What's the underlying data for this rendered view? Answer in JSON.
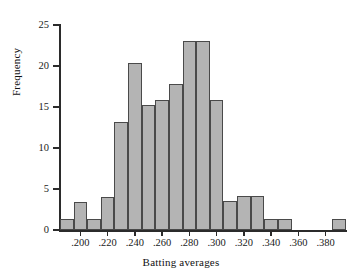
{
  "chart_data": {
    "type": "bar",
    "title": "",
    "xlabel": "Batting averages",
    "ylabel": "Frequency",
    "xlim": [
      0.185,
      0.395
    ],
    "ylim": [
      0,
      25
    ],
    "grid": false,
    "legend": null,
    "bin_width": 0.01,
    "xticks": [
      ".200",
      ".220",
      ".240",
      ".260",
      ".280",
      ".300",
      ".320",
      ".340",
      ".360",
      ".380"
    ],
    "xtick_values": [
      0.2,
      0.22,
      0.24,
      0.26,
      0.28,
      0.3,
      0.32,
      0.34,
      0.36,
      0.38
    ],
    "yticks": [
      "0",
      "5",
      "10",
      "15",
      "20",
      "25"
    ],
    "ytick_values": [
      0,
      5,
      10,
      15,
      20,
      25
    ],
    "bar_color": "#b4b4b4",
    "bar_edge_color": "#4a4a4a",
    "axis_color": "#2b2b2b",
    "bins": [
      {
        "x0": 0.185,
        "x1": 0.195,
        "value": 1.3
      },
      {
        "x0": 0.195,
        "x1": 0.205,
        "value": 3.4
      },
      {
        "x0": 0.205,
        "x1": 0.215,
        "value": 1.3
      },
      {
        "x0": 0.215,
        "x1": 0.225,
        "value": 4.0
      },
      {
        "x0": 0.225,
        "x1": 0.235,
        "value": 13.2
      },
      {
        "x0": 0.235,
        "x1": 0.245,
        "value": 20.4
      },
      {
        "x0": 0.245,
        "x1": 0.255,
        "value": 15.3
      },
      {
        "x0": 0.255,
        "x1": 0.265,
        "value": 15.8
      },
      {
        "x0": 0.265,
        "x1": 0.275,
        "value": 17.8
      },
      {
        "x0": 0.275,
        "x1": 0.285,
        "value": 23.0
      },
      {
        "x0": 0.285,
        "x1": 0.295,
        "value": 23.0
      },
      {
        "x0": 0.295,
        "x1": 0.305,
        "value": 15.8
      },
      {
        "x0": 0.305,
        "x1": 0.315,
        "value": 3.5
      },
      {
        "x0": 0.315,
        "x1": 0.325,
        "value": 4.2
      },
      {
        "x0": 0.325,
        "x1": 0.335,
        "value": 4.2
      },
      {
        "x0": 0.335,
        "x1": 0.345,
        "value": 1.3
      },
      {
        "x0": 0.345,
        "x1": 0.355,
        "value": 1.3
      },
      {
        "x0": 0.355,
        "x1": 0.365,
        "value": 0
      },
      {
        "x0": 0.365,
        "x1": 0.375,
        "value": 0
      },
      {
        "x0": 0.375,
        "x1": 0.385,
        "value": 0
      },
      {
        "x0": 0.385,
        "x1": 0.395,
        "value": 1.3
      }
    ],
    "categories": [
      ".185-.195",
      ".195-.205",
      ".205-.215",
      ".215-.225",
      ".225-.235",
      ".235-.245",
      ".245-.255",
      ".255-.265",
      ".265-.275",
      ".275-.285",
      ".285-.295",
      ".295-.305",
      ".305-.315",
      ".315-.325",
      ".325-.335",
      ".335-.345",
      ".345-.355",
      ".355-.365",
      ".365-.375",
      ".375-.385",
      ".385-.395"
    ],
    "values": [
      1.3,
      3.4,
      1.3,
      4.0,
      13.2,
      20.4,
      15.3,
      15.8,
      17.8,
      23.0,
      23.0,
      15.8,
      3.5,
      4.2,
      4.2,
      1.3,
      1.3,
      0,
      0,
      0,
      1.3
    ]
  }
}
